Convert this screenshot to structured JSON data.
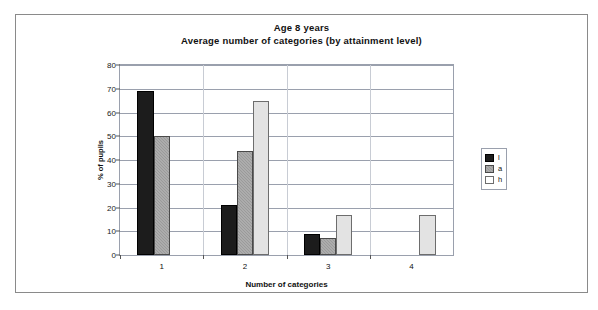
{
  "chart_data": {
    "type": "bar",
    "title": "Age 8 years",
    "subtitle": "Average number of categories (by attainment level)",
    "xlabel": "Number of categories",
    "ylabel": "% of pupils",
    "categories": [
      "1",
      "2",
      "3",
      "4"
    ],
    "yticks": [
      "0",
      "10",
      "20",
      "30",
      "40",
      "50",
      "60",
      "70",
      "80"
    ],
    "ylim": [
      0,
      80
    ],
    "grid": true,
    "legend_position": "right",
    "series": [
      {
        "name": "l",
        "color": "#1c1c1c",
        "values": [
          69,
          21,
          9,
          0
        ]
      },
      {
        "name": "a",
        "color": "#9a9a9a",
        "values": [
          50,
          44,
          7,
          0
        ]
      },
      {
        "name": "h",
        "color": "#e3e3e3",
        "values": [
          0,
          65,
          17,
          17
        ]
      }
    ]
  }
}
